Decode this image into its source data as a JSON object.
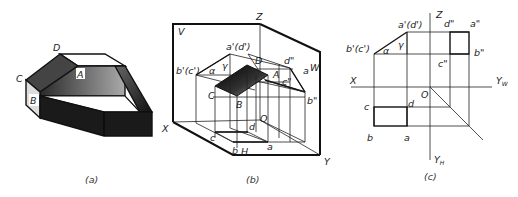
{
  "figure_a": {
    "caption": "(a)",
    "labels": {
      "D": "D",
      "C": "C",
      "A": "A",
      "B": "B"
    }
  },
  "figure_b": {
    "caption": "(b)",
    "labels": {
      "Z": "Z",
      "V": "V",
      "W": "W",
      "X": "X",
      "Y": "Y",
      "H": "H",
      "O": "O",
      "a_prime_d_prime": "a'(d')",
      "b_prime_c_prime": "b'(c')",
      "alpha": "α",
      "gamma": "γ",
      "D": "D",
      "A": "A",
      "C": "C",
      "B": "B",
      "d_dprime": "d\"",
      "a_dprime": "a",
      "c_dprime": "c\"",
      "b_dprime": "b\"",
      "c": "c",
      "d": "d",
      "b": "b",
      "a": "a"
    }
  },
  "figure_c": {
    "caption": "(c)",
    "labels": {
      "Z": "Z",
      "X": "X",
      "Yw": "Y",
      "Yw_sub": "W",
      "Yh": "Y",
      "Yh_sub": "H",
      "O": "O",
      "a_prime_d_prime": "a'(d')",
      "b_prime_c_prime": "b'(c')",
      "alpha": "α",
      "gamma": "γ",
      "d_dprime": "d\"",
      "a_dprime": "a\"",
      "b_dprime": "b\"",
      "c_dprime": "c\"",
      "c": "c",
      "d": "d",
      "b": "b",
      "a": "a"
    }
  }
}
